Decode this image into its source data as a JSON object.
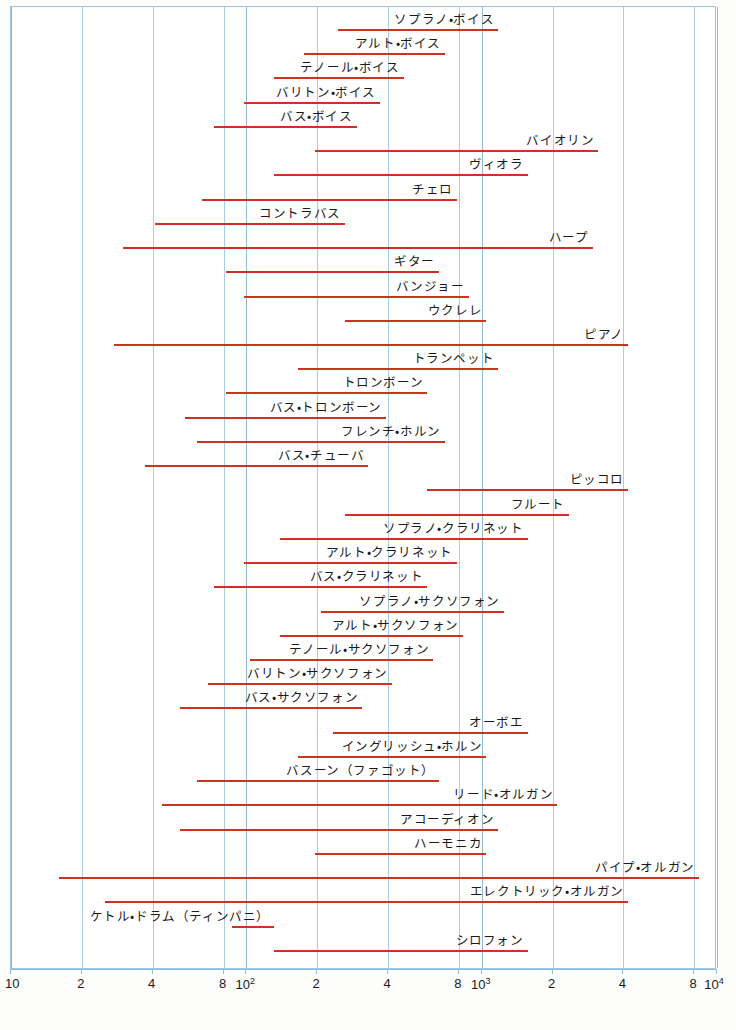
{
  "chart_data": {
    "type": "bar",
    "xlabel": "",
    "ylabel": "",
    "xscale": "log",
    "xlim": [
      10,
      10000
    ],
    "xunit": "Hz",
    "grid": true,
    "legend": "none",
    "bar_color": "#cc3322",
    "grid_color": "#a9cde6",
    "axis_ticks": [
      {
        "label": "10",
        "value": 10,
        "sup": ""
      },
      {
        "label": "2",
        "value": 20,
        "sup": ""
      },
      {
        "label": "4",
        "value": 40,
        "sup": ""
      },
      {
        "label": "8",
        "value": 80,
        "sup": ""
      },
      {
        "label": "10",
        "value": 100,
        "sup": "2"
      },
      {
        "label": "2",
        "value": 200,
        "sup": ""
      },
      {
        "label": "4",
        "value": 400,
        "sup": ""
      },
      {
        "label": "8",
        "value": 800,
        "sup": ""
      },
      {
        "label": "10",
        "value": 1000,
        "sup": "3"
      },
      {
        "label": "2",
        "value": 2000,
        "sup": ""
      },
      {
        "label": "4",
        "value": 4000,
        "sup": ""
      },
      {
        "label": "8",
        "value": 8000,
        "sup": ""
      },
      {
        "label": "10",
        "value": 10000,
        "sup": "4"
      }
    ],
    "gridlines": [
      10,
      20,
      40,
      80,
      100,
      200,
      400,
      800,
      1000,
      2000,
      4000,
      8000,
      10000
    ],
    "categories": [
      "ソプラノ・ボイス",
      "アルト・ボイス",
      "テノール・ボイス",
      "バリトン・ボイス",
      "バス・ボイス",
      "バイオリン",
      "ヴィオラ",
      "チェロ",
      "コントラバス",
      "ハープ",
      "ギター",
      "バンジョー",
      "ウクレレ",
      "ピアノ",
      "トランペット",
      "トロンボーン",
      "バス・トロンボーン",
      "フレンチ・ホルン",
      "バス・チューバ",
      "ピッコロ",
      "フルート",
      "ソプラノ・クラリネット",
      "アルト・クラリネット",
      "バス・クラリネット",
      "ソプラノ・サクソフォン",
      "アルト・サクソフォン",
      "テノール・サクソフォン",
      "バリトン・サクソフォン",
      "バス・サクソフォン",
      "オーボエ",
      "イングリッシュ・ホルン",
      "バスーン（ファゴット）",
      "リード・オルガン",
      "アコーディオン",
      "ハーモニカ",
      "パイプ・オルガン",
      "エレクトリック・オルガン",
      "ケトル・ドラム（ティンパニ）",
      "シロフォン"
    ],
    "ranges": [
      {
        "name": "ソプラノ・ボイス",
        "low": 246,
        "high": 1175
      },
      {
        "name": "アルト・ボイス",
        "low": 175,
        "high": 698
      },
      {
        "name": "テノール・ボイス",
        "low": 131,
        "high": 466
      },
      {
        "name": "バリトン・ボイス",
        "low": 98,
        "high": 370
      },
      {
        "name": "バス・ボイス",
        "low": 73,
        "high": 294
      },
      {
        "name": "バイオリン",
        "low": 196,
        "high": 3136
      },
      {
        "name": "ヴィオラ",
        "low": 131,
        "high": 1568
      },
      {
        "name": "チェロ",
        "low": 65,
        "high": 784
      },
      {
        "name": "コントラバス",
        "low": 41,
        "high": 262
      },
      {
        "name": "ハープ",
        "low": 30,
        "high": 2960
      },
      {
        "name": "ギター",
        "low": 82,
        "high": 659
      },
      {
        "name": "バンジョー",
        "low": 98,
        "high": 880
      },
      {
        "name": "ウクレレ",
        "low": 262,
        "high": 1046
      },
      {
        "name": "ピアノ",
        "low": 27.5,
        "high": 4186
      },
      {
        "name": "トランペット",
        "low": 165,
        "high": 1175
      },
      {
        "name": "トロンボーン",
        "low": 82,
        "high": 587
      },
      {
        "name": "バス・トロンボーン",
        "low": 55,
        "high": 392
      },
      {
        "name": "フレンチ・ホルン",
        "low": 62,
        "high": 698
      },
      {
        "name": "バス・チューバ",
        "low": 37,
        "high": 330
      },
      {
        "name": "ピッコロ",
        "low": 587,
        "high": 4186
      },
      {
        "name": "フルート",
        "low": 262,
        "high": 2349
      },
      {
        "name": "ソプラノ・クラリネット",
        "low": 139,
        "high": 1568
      },
      {
        "name": "アルト・クラリネット",
        "low": 98,
        "high": 784
      },
      {
        "name": "バス・クラリネット",
        "low": 73,
        "high": 587
      },
      {
        "name": "ソプラノ・サクソフォン",
        "low": 208,
        "high": 1245
      },
      {
        "name": "アルト・サクソフォン",
        "low": 139,
        "high": 831
      },
      {
        "name": "テノール・サクソフォン",
        "low": 104,
        "high": 622
      },
      {
        "name": "バリトン・サクソフォン",
        "low": 69,
        "high": 415
      },
      {
        "name": "バス・サクソフォン",
        "low": 52,
        "high": 311
      },
      {
        "name": "オーボエ",
        "low": 233,
        "high": 1568
      },
      {
        "name": "イングリッシュ・ホルン",
        "low": 165,
        "high": 1046
      },
      {
        "name": "バスーン（ファゴット）",
        "low": 62,
        "high": 659
      },
      {
        "name": "リード・オルガン",
        "low": 44,
        "high": 2093
      },
      {
        "name": "アコーディオン",
        "low": 52,
        "high": 1175
      },
      {
        "name": "ハーモニカ",
        "low": 196,
        "high": 1046
      },
      {
        "name": "パイプ・オルガン",
        "low": 16,
        "high": 8372
      },
      {
        "name": "エレクトリック・オルガン",
        "low": 25,
        "high": 4186
      },
      {
        "name": "ケトル・ドラム（ティンパニ）",
        "low": 87,
        "high": 131
      },
      {
        "name": "シロフォン",
        "low": 131,
        "high": 1568
      }
    ]
  },
  "caption": {
    "text": ""
  }
}
